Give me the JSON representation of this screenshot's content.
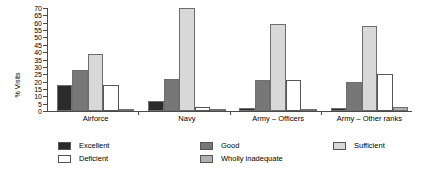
{
  "chart_data": {
    "type": "bar",
    "title": "",
    "subtitle": "",
    "xlabel": "",
    "ylabel": "% Visits",
    "ylim": [
      0,
      70
    ],
    "ytick_step": 5,
    "yticks": [
      0,
      5,
      10,
      15,
      20,
      25,
      30,
      35,
      40,
      45,
      50,
      55,
      60,
      65,
      70
    ],
    "grid": false,
    "legend_position": "bottom",
    "categories": [
      "Airforce",
      "Navy",
      "Army – Officers",
      "Army – Other ranks"
    ],
    "series": [
      {
        "name": "Excellent",
        "color": "#2b2b2b",
        "values": [
          18,
          7,
          2,
          2
        ]
      },
      {
        "name": "Good",
        "color": "#777777",
        "values": [
          28,
          22,
          21,
          20
        ]
      },
      {
        "name": "Sufficient",
        "color": "#d8d8d8",
        "values": [
          39,
          70,
          59,
          58
        ]
      },
      {
        "name": "Deficient",
        "color": "#ffffff",
        "values": [
          18,
          3,
          21,
          25
        ]
      },
      {
        "name": "Wholly inadequate",
        "color": "#b0b0b0",
        "values": [
          0.6,
          1.2,
          1.2,
          2.5
        ]
      }
    ]
  },
  "legend": {
    "columns": [
      {
        "items": [
          {
            "label": "Excellent",
            "color": "#2b2b2b"
          },
          {
            "label": "Deficient",
            "color": "#ffffff"
          }
        ]
      },
      {
        "items": [
          {
            "label": "Good",
            "color": "#777777"
          },
          {
            "label": "Wholly inadequate",
            "color": "#b0b0b0"
          }
        ]
      },
      {
        "items": [
          {
            "label": "Sufficient",
            "color": "#d8d8d8"
          }
        ]
      }
    ]
  }
}
